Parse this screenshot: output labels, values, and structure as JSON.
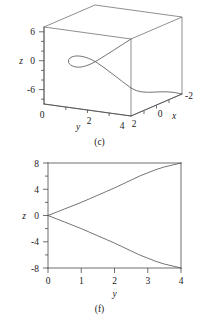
{
  "figure": {
    "panels": [
      {
        "id": "c",
        "caption": "(c)",
        "kind": "3d-space-curve",
        "axes": {
          "z": {
            "label": "z",
            "ticks": [
              "6",
              "0",
              "-6"
            ],
            "range": [
              -8,
              8
            ]
          },
          "y": {
            "label": "y",
            "ticks": [
              "0",
              "2",
              "4"
            ],
            "range": [
              0,
              4
            ]
          },
          "x": {
            "label": "x",
            "ticks": [
              "2",
              "0",
              "-2"
            ],
            "range": [
              -2,
              2
            ]
          }
        }
      },
      {
        "id": "f",
        "caption": "(f)",
        "kind": "2d-xy",
        "axes": {
          "z": {
            "label": "z",
            "ticks": [
              "8",
              "4",
              "0",
              "-4",
              "-8"
            ],
            "range": [
              -8,
              8
            ]
          },
          "y": {
            "label": "y",
            "ticks": [
              "0",
              "1",
              "2",
              "3",
              "4"
            ],
            "range": [
              0,
              4
            ]
          }
        }
      }
    ]
  },
  "chart_data": [
    {
      "type": "line",
      "panel": "c",
      "title": "(c)",
      "xlabel": "y",
      "ylabel": "z",
      "zlabel": "x",
      "projection": "3d-box",
      "grid": false,
      "legend": null,
      "axis_ticks": {
        "z": [
          6,
          0,
          -6
        ],
        "y": [
          0,
          2,
          4
        ],
        "x": [
          2,
          0,
          -2
        ]
      },
      "axis_ranges": {
        "z": [
          -8,
          8
        ],
        "y": [
          0,
          4
        ],
        "x": [
          -2,
          2
        ]
      },
      "series": [
        {
          "name": "space curve",
          "note": "self-intersecting space curve with a small loop near y~1, z~1; one branch rises to the back-top edge, the other descends to the front-right lower corner",
          "points_yz": [
            [
              0.55,
              1.3
            ],
            [
              0.75,
              1.9
            ],
            [
              1.05,
              2.0
            ],
            [
              1.3,
              1.6
            ],
            [
              1.45,
              1.0
            ],
            [
              1.3,
              0.55
            ],
            [
              1.0,
              0.7
            ],
            [
              0.85,
              1.2
            ],
            [
              1.2,
              2.1
            ],
            [
              1.9,
              3.6
            ],
            [
              2.6,
              5.0
            ],
            [
              3.2,
              6.0
            ],
            [
              3.55,
              6.4
            ]
          ],
          "points_yz_branch2": [
            [
              0.9,
              1.0
            ],
            [
              1.6,
              -0.4
            ],
            [
              2.4,
              -2.2
            ],
            [
              3.2,
              -4.4
            ],
            [
              3.9,
              -6.6
            ]
          ]
        }
      ]
    },
    {
      "type": "line",
      "panel": "f",
      "title": "(f)",
      "xlabel": "y",
      "ylabel": "z",
      "grid": false,
      "legend": null,
      "xlim": [
        0,
        4
      ],
      "ylim": [
        -8,
        8
      ],
      "xticks": [
        0,
        1,
        2,
        3,
        4
      ],
      "yticks": [
        -8,
        -4,
        0,
        4,
        8
      ],
      "x": [
        0,
        0.25,
        0.5,
        0.75,
        1,
        1.25,
        1.5,
        1.75,
        2,
        2.25,
        2.5,
        2.75,
        3,
        3.25,
        3.5,
        3.75,
        4
      ],
      "series": [
        {
          "name": "upper branch",
          "values": [
            0,
            0.5,
            1.0,
            1.5,
            2.0,
            2.55,
            3.1,
            3.65,
            4.2,
            4.8,
            5.4,
            6.0,
            6.5,
            7.0,
            7.4,
            7.7,
            8.0
          ]
        },
        {
          "name": "lower branch",
          "values": [
            0,
            -0.5,
            -1.0,
            -1.5,
            -2.0,
            -2.55,
            -3.1,
            -3.65,
            -4.2,
            -4.8,
            -5.4,
            -6.0,
            -6.5,
            -7.0,
            -7.4,
            -7.7,
            -8.0
          ]
        }
      ]
    }
  ],
  "labels": {
    "panel_c": {
      "z_axis": "z",
      "z_t0": "6",
      "z_t1": "0",
      "z_t2": "-6",
      "y_axis": "y",
      "y_t0": "0",
      "y_t1": "2",
      "y_t2": "4",
      "x_axis": "x",
      "x_t0": "2",
      "x_t1": "0",
      "x_t2": "-2",
      "caption": "(c)"
    },
    "panel_f": {
      "z_axis": "z",
      "z_t8": "8",
      "z_t4": "4",
      "z_t0": "0",
      "z_tm4": "-4",
      "z_tm8": "-8",
      "y_axis": "y",
      "y_t0": "0",
      "y_t1": "1",
      "y_t2": "2",
      "y_t3": "3",
      "y_t4": "4",
      "caption": "(f)"
    }
  }
}
